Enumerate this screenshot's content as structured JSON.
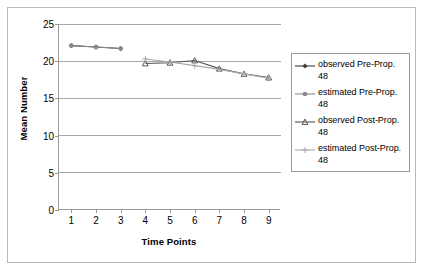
{
  "chart_data": {
    "type": "line",
    "title": "",
    "xlabel": "Time Points",
    "ylabel": "Mean Number",
    "x": [
      1,
      2,
      3,
      4,
      5,
      6,
      7,
      8,
      9
    ],
    "xlim": [
      0.5,
      9.5
    ],
    "ylim": [
      0,
      25
    ],
    "yticks": [
      0,
      5,
      10,
      15,
      20,
      25
    ],
    "xticks": [
      1,
      2,
      3,
      4,
      5,
      6,
      7,
      8,
      9
    ],
    "ytick_labels": [
      "0",
      "5",
      "10",
      "15",
      "20",
      "25"
    ],
    "xtick_labels": [
      "1",
      "2",
      "3",
      "4",
      "5",
      "6",
      "7",
      "8",
      "9"
    ],
    "grid": "horizontal",
    "legend_position": "right",
    "series": [
      {
        "name": "observed Pre-Prop. 48",
        "color": "#3f3f3f",
        "marker": "diamond",
        "x": [
          1,
          2,
          3
        ],
        "values": [
          22.1,
          21.9,
          21.7
        ]
      },
      {
        "name": "estimated Pre-Prop. 48",
        "color": "#8a8a8a",
        "marker": "circle",
        "x": [
          1,
          2,
          3
        ],
        "values": [
          22.1,
          21.9,
          21.7
        ]
      },
      {
        "name": "observed Post-Prop. 48",
        "color": "#555555",
        "marker": "triangle",
        "x": [
          4,
          5,
          6,
          7,
          8,
          9
        ],
        "values": [
          19.7,
          19.8,
          20.1,
          19.0,
          18.3,
          17.8
        ]
      },
      {
        "name": "estimated Post-Prop. 48",
        "color": "#a8a8a8",
        "marker": "cross",
        "x": [
          4,
          5,
          6,
          7,
          8,
          9
        ],
        "values": [
          20.3,
          19.9,
          19.4,
          18.9,
          18.3,
          17.7
        ]
      }
    ]
  },
  "legend": {
    "entries": [
      {
        "label": "observed Pre-Prop. 48"
      },
      {
        "label": "estimated Pre-Prop. 48"
      },
      {
        "label": "observed Post-Prop. 48"
      },
      {
        "label": "estimated Post-Prop. 48"
      }
    ]
  },
  "colors": {
    "axis": "#9a9a9a",
    "grid": "#a6a6a6",
    "frame": "#b9b9b9",
    "text": "#000000",
    "background": "#ffffff"
  }
}
